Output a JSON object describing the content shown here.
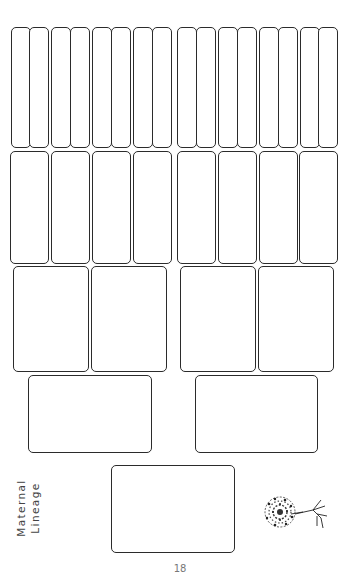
{
  "page": {
    "type": "family-tree-worksheet",
    "title_vertical": [
      "Maternal",
      "Lineage"
    ],
    "page_number": "18",
    "border_color": "#2b2b2b",
    "background": "#ffffff"
  },
  "generations": [
    {
      "name": "great-great-grandparents",
      "count": 16
    },
    {
      "name": "great-grandparents",
      "count": 8
    },
    {
      "name": "grandparents",
      "count": 4
    },
    {
      "name": "parents",
      "count": 2
    },
    {
      "name": "self",
      "count": 1
    }
  ],
  "decoration": {
    "icon": "tree-icon"
  }
}
